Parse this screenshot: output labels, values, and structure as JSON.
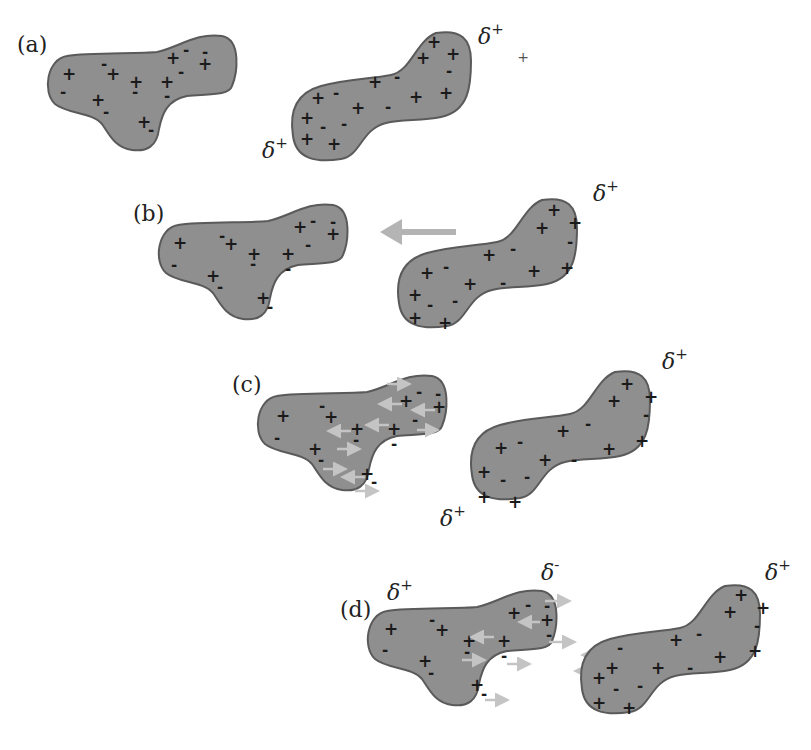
{
  "figure": {
    "colors": {
      "blob_fill": "#8f8f8f",
      "blob_stroke": "#5a5a5a",
      "approach_arrow": "#b4b4b4",
      "electron_shift_arrows": "#c4c4c4",
      "charge_glyph": "#1a1a1a"
    },
    "panels": [
      {
        "label": "(a)",
        "annotations": [
          "δ+",
          "δ+",
          "+"
        ],
        "left_blob_charges": {
          "plus": 8,
          "minus": 8
        },
        "right_blob_charges": {
          "plus": 12,
          "minus": 7
        }
      },
      {
        "label": "(b)",
        "annotations": [
          "δ+"
        ],
        "approach_arrow": "left",
        "left_blob_charges": {
          "plus": 8,
          "minus": 8
        },
        "right_blob_charges": {
          "plus": 12,
          "minus": 7
        }
      },
      {
        "label": "(c)",
        "annotations": [
          "δ+",
          "δ+"
        ],
        "electron_shift_arrows": true,
        "left_blob_charges": {
          "plus": 8,
          "minus": 8
        },
        "right_blob_charges": {
          "plus": 12,
          "minus": 7
        }
      },
      {
        "label": "(d)",
        "annotations": [
          "δ+",
          "δ-",
          "δ+"
        ],
        "electron_shift_arrows": true,
        "left_blob_charges": {
          "plus": 8,
          "minus": 8
        },
        "right_blob_charges": {
          "plus": 12,
          "minus": 7
        }
      }
    ]
  },
  "text": {
    "label_a": "(a)",
    "label_b": "(b)",
    "label_c": "(c)",
    "label_d": "(d)",
    "delta": "δ",
    "sup_plus": "+",
    "sup_minus": "-",
    "stray_plus": "+"
  }
}
